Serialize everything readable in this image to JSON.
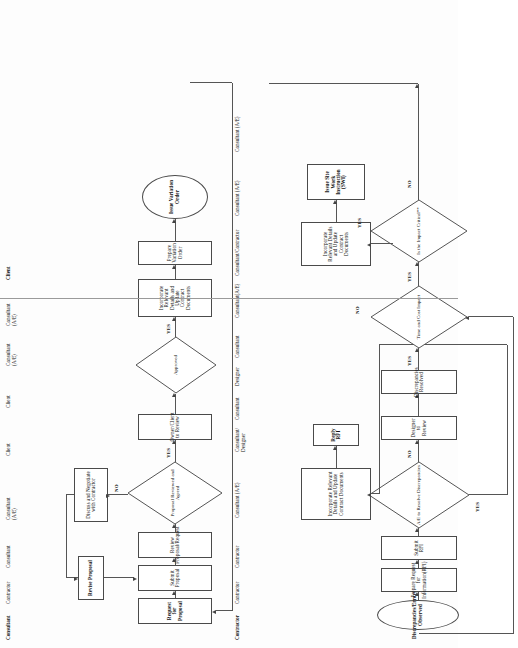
{
  "document": {
    "type": "flowchart",
    "orientation": "rotated-90-ccw",
    "title": "Construction Variation / RFI Process Flowcharts"
  },
  "flow_top": {
    "name": "Variation Order Process",
    "roles": [
      "Consultant",
      "Contractor",
      "Consultant",
      "Consultant (A/E)",
      "Client",
      "Client",
      "Consultant (A/E)",
      "Consultant (A/E)",
      "Client"
    ],
    "nodes": {
      "request_for_proposal": "Request for Proposal",
      "submit_proposal": "Submit Proposal",
      "review_proposal_request": "Review Proposal/Request",
      "proposal_reviewed_and_agreed": "Proposal Reviewed and Agreed",
      "owner_client_to_review": "Owner/Client to Review",
      "approved": "Approved",
      "incorporate_relevant_details": "Incorporate Relevant Details and Update Contract Documents",
      "prepare_variation_order": "Prepare Variation Order",
      "issue_variation_order": "Issue Variation Order",
      "revise_proposal": "Revise Proposal",
      "discuss_and_negotiate": "Discuss and Negotiate with Contractor"
    },
    "edge_labels": {
      "no_from_agreed": "NO",
      "yes_from_agreed": "YES",
      "yes_from_approved": "YES"
    }
  },
  "flow_bottom": {
    "name": "RFI / Site Work Instruction Process",
    "roles": [
      "Contractor",
      "Contractor",
      "Contractor",
      "Consultant (A/E)",
      "Consultant/\nDesigner",
      "Consultant",
      "Designer",
      "Consultant",
      "Consultant(A/E)",
      "Consultant/Contractor",
      "Consultant (A/E)",
      "Consultant (A/E)"
    ],
    "nodes": {
      "discrepancies_errors_observed": "Discrepancies/Errors Observed",
      "prepare_request_for_information": "Prepare Request for Information(RFI)",
      "submit_rfi": "Submit RFI",
      "ae_to_resolve_discrepancies": "A/E to Resolve Discrepancies",
      "designer_to_review": "Designer to Review",
      "discrepancies_resolved": "Discrepancies Resolved",
      "time_and_cost_impact": "Time and Cost Impact",
      "is_the_impact_critical": "Is the Impact Critical**",
      "incorporate_relevant_details_left": "Incorporate Relevant Details and Update Contract Documents",
      "reply_rfi": "Reply RFI",
      "incorporate_relevant_details_right": "Incorporate Relevant Details and Update Contract Documents",
      "issue_site_work_instruction": "Issue Site Work Instruction (SWI)"
    },
    "edge_labels": {
      "yes_ae_resolve": "YES",
      "no_ae_resolve": "NO",
      "yes_resolved": "YES",
      "no_time_cost": "NO",
      "yes_time_cost": "YES",
      "yes_critical": "YES",
      "no_critical": "NO"
    }
  },
  "colors": {
    "line": "#555555",
    "border": "#4a4a4a",
    "background": "#fdfdfd",
    "text": "#111111"
  }
}
